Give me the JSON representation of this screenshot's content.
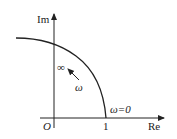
{
  "diagram": {
    "type": "nyquist-plot",
    "axes": {
      "y_label": "Im",
      "x_label": "Re",
      "origin_label": "O",
      "x_tick_label": "1"
    },
    "annotations": {
      "omega_zero": "ω=0",
      "omega_infinity": "∞",
      "omega_direction": "ω"
    },
    "colors": {
      "stroke": "#222222",
      "background": "#ffffff"
    }
  }
}
